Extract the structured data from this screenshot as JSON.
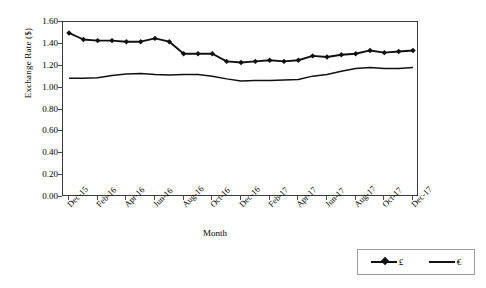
{
  "chart_data": {
    "type": "line",
    "title": "",
    "xlabel": "Month",
    "ylabel": "Exchange Rate ($)",
    "ylim": [
      0.0,
      1.6
    ],
    "ytick_labels": [
      "0.00",
      "0.20",
      "0.40",
      "0.60",
      "0.80",
      "1.00",
      "1.20",
      "1.40",
      "1.60"
    ],
    "ytick_values": [
      0.0,
      0.2,
      0.4,
      0.6,
      0.8,
      1.0,
      1.2,
      1.4,
      1.6
    ],
    "grid": false,
    "legend_position": "bottom-right",
    "x": [
      "Dec-15",
      "Jan-16",
      "Feb-16",
      "Mar-16",
      "Apr-16",
      "May-16",
      "Jun-16",
      "Jul-16",
      "Aug-16",
      "Sep-16",
      "Oct-16",
      "Nov-16",
      "Dec-16",
      "Jan-17",
      "Feb-17",
      "Mar-17",
      "Apr-17",
      "May-17",
      "Jun-17",
      "Jul-17",
      "Aug-17",
      "Sep-17",
      "Oct-17",
      "Nov-17",
      "Dec-17"
    ],
    "xtick_labels": [
      "Dec-15",
      "Feb-16",
      "Apr-16",
      "Jun-16",
      "Aug-16",
      "Oct-16",
      "Dec-16",
      "Feb-17",
      "Apr-17",
      "Jun-17",
      "Aug-17",
      "Oct-17",
      "Dec-17"
    ],
    "xtick_indices": [
      0,
      2,
      4,
      6,
      8,
      10,
      12,
      14,
      16,
      18,
      20,
      22,
      24
    ],
    "series": [
      {
        "name": "£",
        "marker": "diamond",
        "color": "#111111",
        "values": [
          1.5,
          1.44,
          1.43,
          1.43,
          1.42,
          1.42,
          1.45,
          1.42,
          1.31,
          1.31,
          1.31,
          1.24,
          1.23,
          1.24,
          1.25,
          1.24,
          1.25,
          1.29,
          1.28,
          1.3,
          1.31,
          1.34,
          1.32,
          1.33,
          1.34
        ]
      },
      {
        "name": "€",
        "marker": "none",
        "color": "#111111",
        "values": [
          1.085,
          1.085,
          1.09,
          1.11,
          1.125,
          1.13,
          1.12,
          1.115,
          1.12,
          1.12,
          1.105,
          1.08,
          1.06,
          1.065,
          1.065,
          1.07,
          1.075,
          1.105,
          1.12,
          1.15,
          1.175,
          1.185,
          1.175,
          1.175,
          1.185
        ]
      }
    ],
    "legend": [
      {
        "label": "£",
        "marker": "diamond"
      },
      {
        "label": "€",
        "marker": "none"
      }
    ]
  }
}
